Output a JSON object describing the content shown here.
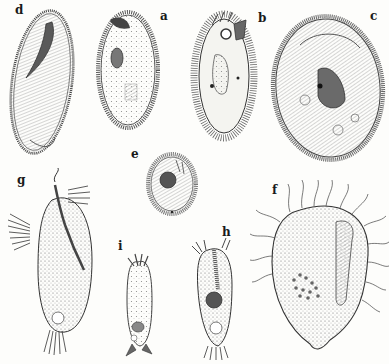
{
  "plate": {
    "background": "#fdfdfb",
    "ink_color": "#2a2a2a",
    "figures": [
      {
        "id": "a",
        "label": "a",
        "subject": "oval ciliate with dense peripheral cilia, nucleus and vacuoles",
        "label_pos": [
          163,
          18
        ]
      },
      {
        "id": "b",
        "label": "b",
        "subject": "elongated ciliate with long cilia and oral apparatus",
        "label_pos": [
          261,
          16
        ]
      },
      {
        "id": "c",
        "label": "c",
        "subject": "large oval ciliate with striated body and central nucleus",
        "label_pos": [
          372,
          14
        ]
      },
      {
        "id": "d",
        "label": "d",
        "subject": "elongate slipper-shaped ciliate with curved macronucleus",
        "label_pos": [
          17,
          13
        ]
      },
      {
        "id": "e",
        "label": "e",
        "subject": "small oval ciliate with dark nucleus",
        "label_pos": [
          133,
          152
        ]
      },
      {
        "id": "f",
        "label": "f",
        "subject": "broad pear-shaped ciliate with long sparse cilia and food vacuoles",
        "label_pos": [
          274,
          188
        ]
      },
      {
        "id": "g",
        "label": "g",
        "subject": "stalked ciliate with fan-like cirri and dotted cytoplasm",
        "label_pos": [
          19,
          178
        ]
      },
      {
        "id": "h",
        "label": "h",
        "subject": "narrow flask-shaped ciliate with oral membranelles and contractile vacuole",
        "label_pos": [
          224,
          230
        ]
      },
      {
        "id": "i",
        "label": "i",
        "subject": "small cylindrical ciliate with anterior and posterior tufts",
        "label_pos": [
          119,
          242
        ]
      }
    ]
  }
}
